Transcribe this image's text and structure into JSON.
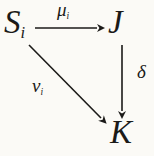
{
  "diagram": {
    "type": "commutative-diagram",
    "colors": {
      "background": "#fbfaf6",
      "ink": "#1b1a18"
    },
    "nodes": {
      "s": {
        "base": "S",
        "sub": "i"
      },
      "j": {
        "label": "J"
      },
      "k": {
        "label": "K"
      }
    },
    "arrows": {
      "mu": {
        "base": "μ",
        "sub": "i",
        "from": "S_i",
        "to": "J",
        "direction": "horizontal-right"
      },
      "delta": {
        "label": "δ",
        "from": "J",
        "to": "K",
        "direction": "vertical-down"
      },
      "nu": {
        "base": "ν",
        "sub": "i",
        "from": "S_i",
        "to": "K",
        "direction": "diagonal-down-right"
      }
    }
  }
}
